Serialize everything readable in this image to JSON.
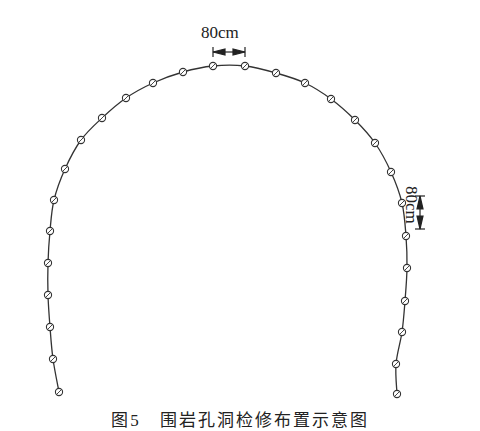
{
  "diagram": {
    "type": "tunnel-arch-layout",
    "line_color": "#333333",
    "point_style": "open-circle-with-slash",
    "points": [
      [
        59,
        392
      ],
      [
        53,
        359
      ],
      [
        50,
        327
      ],
      [
        48,
        295
      ],
      [
        48,
        263
      ],
      [
        50,
        231
      ],
      [
        54,
        200
      ],
      [
        65,
        169
      ],
      [
        81,
        140
      ],
      [
        102,
        118
      ],
      [
        126,
        98
      ],
      [
        153,
        83
      ],
      [
        183,
        72
      ],
      [
        213,
        66
      ],
      [
        245,
        66
      ],
      [
        276,
        73
      ],
      [
        305,
        83
      ],
      [
        331,
        99
      ],
      [
        355,
        120
      ],
      [
        375,
        143
      ],
      [
        391,
        172
      ],
      [
        402,
        203
      ],
      [
        406,
        236
      ],
      [
        407,
        268
      ],
      [
        405,
        301
      ],
      [
        402,
        332
      ],
      [
        396,
        364
      ],
      [
        397,
        394
      ]
    ],
    "spacing_label_top": "80cm",
    "spacing_label_side": "80cm",
    "caption": "图5　围岩孔洞检修布置示意图"
  }
}
